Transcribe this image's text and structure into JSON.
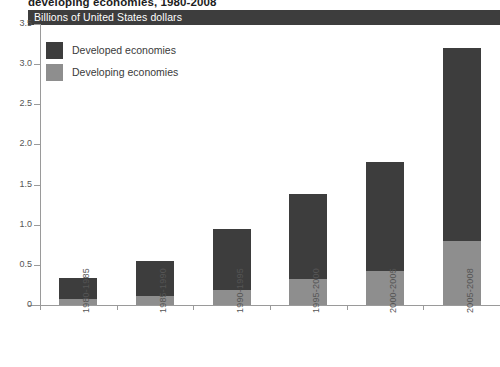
{
  "title": "developing economies, 1980-2008",
  "header_band": {
    "label": "Billions of United States dollars"
  },
  "legend": {
    "items": [
      {
        "label": "Developed economies",
        "color": "#3d3d3d",
        "key": "developed"
      },
      {
        "label": "Developing economies",
        "color": "#8e8e8e",
        "key": "developing"
      }
    ]
  },
  "axes": {
    "y_ticks": [
      "0",
      "0.5",
      "1.0",
      "1.5",
      "2.0",
      "2.5",
      "3.0",
      "3.5"
    ],
    "x_ticks": [
      "1980-1985",
      "1985-1990",
      "1990-1995",
      "1995-2000",
      "2000-2005",
      "2005-2008"
    ]
  },
  "chart_data": {
    "type": "bar",
    "title": "developing economies, 1980-2008",
    "subtitle": "Billions of United States dollars",
    "xlabel": "",
    "ylabel": "Billions of United States dollars",
    "ylim": [
      0,
      3.5
    ],
    "ytick_values": [
      0,
      0.5,
      1.0,
      1.5,
      2.0,
      2.5,
      3.0,
      3.5
    ],
    "grid": false,
    "stacked": true,
    "legend_position": "top-left",
    "categories": [
      "1980-1985",
      "1985-1990",
      "1990-1995",
      "1995-2000",
      "2000-2005",
      "2005-2008"
    ],
    "series": [
      {
        "name": "Developing economies",
        "color": "#8e8e8e",
        "values": [
          0.08,
          0.11,
          0.19,
          0.32,
          0.42,
          0.8
        ]
      },
      {
        "name": "Developed economies",
        "color": "#3d3d3d",
        "values": [
          0.26,
          0.44,
          0.76,
          1.06,
          1.36,
          2.4
        ]
      }
    ],
    "totals": [
      0.34,
      0.55,
      0.95,
      1.38,
      1.78,
      3.2
    ]
  }
}
